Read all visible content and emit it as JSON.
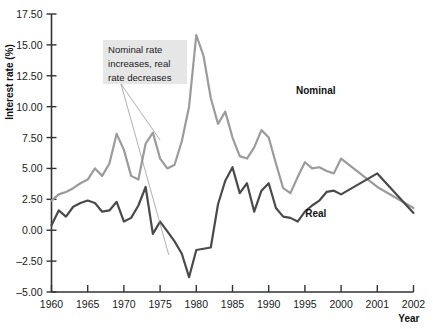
{
  "chart_data": {
    "type": "line",
    "title": "",
    "xlabel": "Year",
    "ylabel": "Interest rate (%)",
    "ylim": [
      -5.0,
      17.5
    ],
    "ytick_values": [
      -5.0,
      -2.5,
      0.0,
      2.5,
      5.0,
      7.5,
      10.0,
      12.5,
      15.0,
      17.5
    ],
    "ytick_labels": [
      "–5.00",
      "–2.50",
      "0.00",
      "2.50",
      "5.00",
      "7.50",
      "10.00",
      "12.50",
      "15.00",
      "17.50"
    ],
    "xtick_labels": [
      "1960",
      "1965",
      "1970",
      "1975",
      "1980",
      "1985",
      "1990",
      "1995",
      "2000",
      "2001",
      "2002"
    ],
    "xtick_positions": [
      1960,
      1965,
      1970,
      1975,
      1980,
      1985,
      1990,
      1995,
      2000,
      2001,
      2002
    ],
    "grid": false,
    "legend_position": "inline-labels",
    "x": [
      1960,
      1961,
      1962,
      1963,
      1964,
      1965,
      1966,
      1967,
      1968,
      1969,
      1970,
      1971,
      1972,
      1973,
      1974,
      1975,
      1976,
      1977,
      1978,
      1979,
      1980,
      1981,
      1982,
      1983,
      1984,
      1985,
      1986,
      1987,
      1988,
      1989,
      1990,
      1991,
      1992,
      1993,
      1994,
      1995,
      1996,
      1997,
      1998,
      1999,
      2000,
      2001,
      2002
    ],
    "series": [
      {
        "name": "Nominal",
        "color": "#9b9b9b",
        "label_x": 1996.5,
        "label_y": 11.0,
        "values": [
          2.4,
          2.9,
          3.1,
          3.4,
          3.8,
          4.1,
          5.0,
          4.4,
          5.4,
          7.8,
          6.5,
          4.4,
          4.1,
          7.0,
          7.9,
          5.8,
          5.0,
          5.3,
          7.2,
          10.0,
          15.8,
          14.1,
          10.7,
          8.6,
          9.6,
          7.5,
          6.0,
          5.8,
          6.7,
          8.1,
          7.5,
          5.4,
          3.4,
          3.0,
          4.3,
          5.5,
          5.0,
          5.1,
          4.8,
          4.6,
          5.8,
          3.5,
          1.8
        ]
      },
      {
        "name": "Real",
        "color": "#4a4a4a",
        "label_x": 1996.5,
        "label_y": 1.1,
        "values": [
          0.4,
          1.6,
          1.1,
          1.9,
          2.2,
          2.4,
          2.2,
          1.5,
          1.6,
          2.3,
          0.7,
          1.0,
          2.0,
          3.5,
          -0.3,
          0.7,
          -0.1,
          -0.9,
          -1.9,
          -3.8,
          -1.6,
          -1.5,
          -1.4,
          2.1,
          4.0,
          5.1,
          3.0,
          3.8,
          1.5,
          3.2,
          3.8,
          1.8,
          1.1,
          1.0,
          0.7,
          1.5,
          2.0,
          2.4,
          3.1,
          3.2,
          2.9,
          4.6,
          1.4
        ]
      }
    ],
    "annotations": [
      {
        "text_lines": [
          "Nominal rate",
          "increases, real",
          "rate decreases"
        ],
        "box_fill": "#e6e6e6",
        "leader_targets": [
          {
            "x": 1975.0,
            "y": 7.3
          },
          {
            "x": 1976.2,
            "y": -2.0
          }
        ]
      }
    ]
  },
  "axes": {
    "y_axis_title": "Interest rate (%)",
    "x_axis_title": "Year"
  }
}
